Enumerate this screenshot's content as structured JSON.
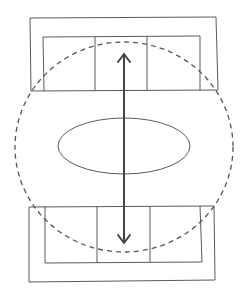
{
  "diagram": {
    "elements": {
      "top_bay": {
        "panels": 3
      },
      "bottom_bay": {
        "panels": 3
      },
      "center_oval": {},
      "dashed_circle": {
        "style": "dashed"
      },
      "arrow": {
        "direction": "bidirectional-vertical"
      }
    },
    "colors": {
      "stroke": "#5a5a5a",
      "arrow": "#444444",
      "dashed": "#555555",
      "background": "#ffffff"
    }
  }
}
